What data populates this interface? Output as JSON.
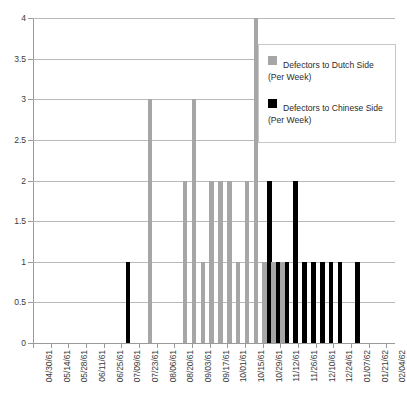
{
  "chart_data": {
    "type": "bar",
    "title": "",
    "subtitle": "",
    "xlabel": "",
    "ylabel": "",
    "ylim": [
      0,
      4
    ],
    "ytick_step": 0.5,
    "grid": true,
    "legend_position": "top-right",
    "ytick_labels": [
      "0",
      "0.5",
      "1",
      "1.5",
      "2",
      "2.5",
      "3",
      "3.5",
      "4"
    ],
    "ytick_values": [
      0,
      0.5,
      1,
      1.5,
      2,
      2.5,
      3,
      3.5,
      4
    ],
    "xtick_labels": [
      "04/30/61",
      "05/14/61",
      "05/28/61",
      "06/11/61",
      "06/25/61",
      "07/09/61",
      "07/23/61",
      "08/06/61",
      "08/20/61",
      "09/03/61",
      "09/17/61",
      "10/01/61",
      "10/15/61",
      "10/29/61",
      "11/12/61",
      "11/26/61",
      "12/10/61",
      "12/24/61",
      "01/07/62",
      "01/21/62",
      "02/04/62"
    ],
    "categories": [
      "04/30/61",
      "05/07/61",
      "05/14/61",
      "05/21/61",
      "05/28/61",
      "06/04/61",
      "06/11/61",
      "06/18/61",
      "06/25/61",
      "07/02/61",
      "07/09/61",
      "07/16/61",
      "07/23/61",
      "07/30/61",
      "08/06/61",
      "08/13/61",
      "08/20/61",
      "08/27/61",
      "09/03/61",
      "09/10/61",
      "09/17/61",
      "09/24/61",
      "10/01/61",
      "10/08/61",
      "10/15/61",
      "10/22/61",
      "10/29/61",
      "11/05/61",
      "11/12/61",
      "11/19/61",
      "11/26/61",
      "12/03/61",
      "12/10/61",
      "12/17/61",
      "12/24/61",
      "12/31/61",
      "01/07/62",
      "01/14/62",
      "01/21/62",
      "01/28/62",
      "02/04/62"
    ],
    "series": [
      {
        "name": "Defectors to Dutch Side (Per Week)",
        "color": "#a6a6a6",
        "values": [
          0,
          0,
          0,
          0,
          0,
          0,
          0,
          0,
          0,
          0,
          0,
          0,
          0,
          3,
          0,
          0,
          0,
          2,
          3,
          1,
          2,
          2,
          2,
          1,
          2,
          4,
          1,
          1,
          1,
          0,
          0,
          0,
          0,
          0,
          0,
          0,
          0,
          0,
          0,
          0,
          0
        ]
      },
      {
        "name": "Defectors to Chinese Side (Per Week)",
        "color": "#000000",
        "values": [
          0,
          0,
          0,
          0,
          0,
          0,
          0,
          0,
          0,
          0,
          1,
          0,
          0,
          0,
          0,
          0,
          0,
          0,
          0,
          0,
          0,
          0,
          0,
          0,
          0,
          0,
          2,
          1,
          1,
          2,
          1,
          1,
          1,
          1,
          1,
          0,
          1,
          0,
          0,
          0,
          0
        ]
      }
    ]
  },
  "legend": {
    "entries": [
      {
        "label_line1": "Defectors to Dutch Side",
        "label_line2": "(Per Week)",
        "color": "#a6a6a6",
        "swatch_name": "legend-swatch-dutch"
      },
      {
        "label_line1": "Defectors to Chinese Side",
        "label_line2": "(Per Week)",
        "color": "#000000",
        "swatch_name": "legend-swatch-chinese"
      }
    ]
  }
}
